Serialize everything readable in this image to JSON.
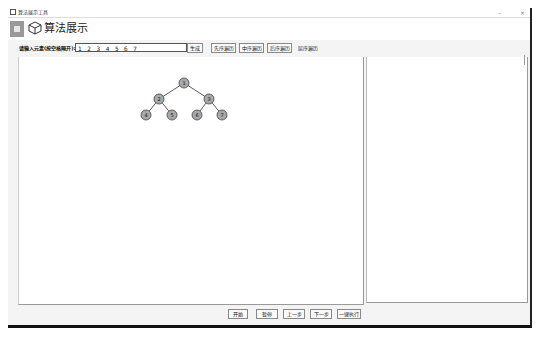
{
  "window": {
    "title": "算法展示工具",
    "controls": {
      "minimize": "–",
      "close": "×"
    }
  },
  "header": {
    "logo_icon": "app-logo-icon",
    "section_icon": "cube-icon",
    "title": "算法展示"
  },
  "toolbar": {
    "input_label": "请输入元素(按空格隔开):",
    "input_value": "1 2 3 4 5 6 7",
    "generate_label": "生成",
    "preorder_label": "先序遍历",
    "inorder_label": "中序遍历",
    "postorder_label": "后序遍历",
    "levelorder_label": "层序遍历"
  },
  "tree": {
    "node_fill": "#a8a8a8",
    "node_stroke": "#444444",
    "nodes": [
      {
        "id": 1,
        "label": "1",
        "x": 184,
        "y": 83
      },
      {
        "id": 2,
        "label": "2",
        "x": 159,
        "y": 99
      },
      {
        "id": 3,
        "label": "3",
        "x": 209,
        "y": 99
      },
      {
        "id": 4,
        "label": "4",
        "x": 146,
        "y": 115
      },
      {
        "id": 5,
        "label": "5",
        "x": 172,
        "y": 115
      },
      {
        "id": 6,
        "label": "6",
        "x": 197,
        "y": 115
      },
      {
        "id": 7,
        "label": "7",
        "x": 222,
        "y": 115
      }
    ],
    "edges": [
      [
        1,
        2
      ],
      [
        1,
        3
      ],
      [
        2,
        4
      ],
      [
        2,
        5
      ],
      [
        3,
        6
      ],
      [
        3,
        7
      ]
    ]
  },
  "controls": {
    "start_label": "开始",
    "pause_label": "暂停",
    "prev_label": "上一步",
    "next_label": "下一步",
    "run_all_label": "一键执行"
  }
}
